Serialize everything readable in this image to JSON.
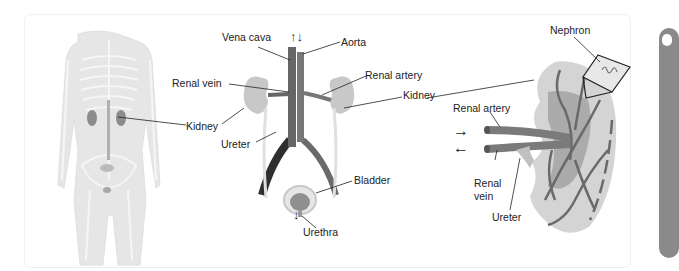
{
  "diagram": {
    "panels": [
      {
        "name": "body-overview",
        "labels": [
          "Kidney"
        ]
      },
      {
        "name": "urinary-tract",
        "labels": [
          "Vena cava",
          "Aorta",
          "Renal vein",
          "Renal artery",
          "Kidney",
          "Kidney",
          "Ureter",
          "Bladder",
          "Urethra"
        ]
      },
      {
        "name": "kidney-cross-section",
        "labels": [
          "Nephron",
          "Kidney",
          "Renal artery",
          "Renal vein",
          "Ureter"
        ]
      }
    ]
  },
  "labels": {
    "body_kidney": "Kidney",
    "vena_cava": "Vena cava",
    "aorta": "Aorta",
    "renal_vein": "Renal vein",
    "renal_artery": "Renal artery",
    "kidney_right": "Kidney",
    "ureter": "Ureter",
    "bladder": "Bladder",
    "urethra": "Urethra",
    "nephron": "Nephron",
    "section_renal_artery": "Renal artery",
    "section_renal_vein_1": "Renal",
    "section_renal_vein_2": "vein",
    "section_ureter": "Ureter",
    "flow_up_down": "↑↓",
    "flow_down": "↓",
    "flow_in": "→",
    "flow_out": "←"
  },
  "colors": {
    "body": "#e6e6e6",
    "bone": "#f4f4f4",
    "kidney": "#c8c8c8",
    "vessel": "#707070",
    "vessel_dark": "#333333",
    "ureter": "#e8e8e8",
    "line": "#222222"
  }
}
